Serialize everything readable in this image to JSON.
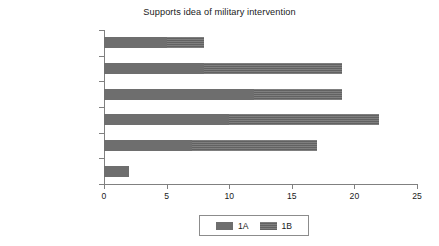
{
  "chart_data": {
    "type": "bar",
    "orientation": "horizontal",
    "stacked": true,
    "title": "Supports idea of military intervention",
    "xlabel": "",
    "ylabel": "",
    "xlim": [
      0,
      25
    ],
    "xticks": [
      0,
      5,
      10,
      15,
      20,
      25
    ],
    "grid": false,
    "legend_position": "bottom-center",
    "categories": [
      "Strongly agree",
      "Agree",
      "Neither",
      "Disagree",
      "Strongly disagree",
      "Can't answer"
    ],
    "series": [
      {
        "name": "1A",
        "color": "#6e6e6e",
        "values": [
          2,
          7,
          10,
          12,
          8,
          5
        ]
      },
      {
        "name": "1B",
        "color": "#666666",
        "values": [
          0,
          10,
          12,
          7,
          11,
          3
        ]
      }
    ],
    "totals": [
      2,
      17,
      22,
      19,
      19,
      8
    ]
  },
  "axis": {
    "xticks": [
      {
        "value": 0,
        "label": "0"
      },
      {
        "value": 5,
        "label": "5"
      },
      {
        "value": 10,
        "label": "10"
      },
      {
        "value": 15,
        "label": "15"
      },
      {
        "value": 20,
        "label": "20"
      },
      {
        "value": 25,
        "label": "25"
      }
    ],
    "ycats": [
      {
        "label": "Can't answer"
      },
      {
        "label": "Strongly disagree"
      },
      {
        "label": "Disagree"
      },
      {
        "label": "Neither"
      },
      {
        "label": "Agree"
      },
      {
        "label": "Strongly agree"
      }
    ]
  },
  "legend": {
    "entries": [
      {
        "label": "1A",
        "color": "#6e6e6e"
      },
      {
        "label": "1B",
        "color": "#666666"
      }
    ]
  }
}
